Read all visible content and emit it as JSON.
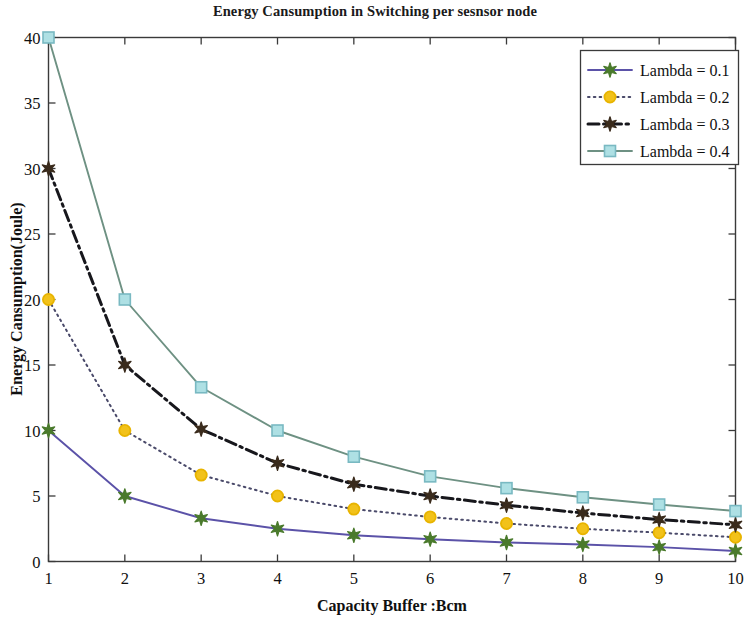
{
  "chart_data": {
    "type": "line",
    "title": "Energy Cansumption in Switching per sesnsor node",
    "xlabel": "Capacity Buffer :Bcm",
    "ylabel": "Energy Cansumption(Joule)",
    "x": [
      1,
      2,
      3,
      4,
      5,
      6,
      7,
      8,
      9,
      10
    ],
    "xlim": [
      1,
      10
    ],
    "ylim": [
      0,
      40
    ],
    "xticks": [
      "1",
      "2",
      "3",
      "4",
      "5",
      "6",
      "7",
      "8",
      "9",
      "10"
    ],
    "yticks": [
      "0",
      "5",
      "10",
      "15",
      "20",
      "25",
      "30",
      "35",
      "40"
    ],
    "grid": false,
    "legend_position": "upper right",
    "series": [
      {
        "name": "Lambda = 0.1",
        "values": [
          10,
          5,
          3.3,
          2.5,
          2,
          1.7,
          1.45,
          1.3,
          1.1,
          0.8
        ],
        "color": "#5b52a8",
        "marker": "star",
        "marker_color": "#4a7a2c",
        "dash": "solid"
      },
      {
        "name": "Lambda = 0.2",
        "values": [
          20,
          10,
          6.6,
          5,
          4,
          3.4,
          2.9,
          2.5,
          2.2,
          1.85
        ],
        "color": "#4a4a6a",
        "marker": "circle",
        "marker_color": "#f2c21a",
        "dash": "dotted"
      },
      {
        "name": "Lambda = 0.3",
        "values": [
          30,
          15,
          10.1,
          7.5,
          5.9,
          5.0,
          4.3,
          3.7,
          3.2,
          2.8
        ],
        "color": "#17171c",
        "marker": "star",
        "marker_color": "#3a2b1c",
        "dash": "dashdot"
      },
      {
        "name": "Lambda = 0.4",
        "values": [
          40,
          20,
          13.3,
          10.0,
          8.0,
          6.5,
          5.6,
          4.9,
          4.35,
          3.85
        ],
        "color": "#6e9183",
        "marker": "square",
        "marker_color": "#aee0e4",
        "dash": "solid"
      }
    ]
  },
  "legend": {
    "entries": [
      {
        "label": "Lambda = 0.1"
      },
      {
        "label": "Lambda = 0.2"
      },
      {
        "label": "Lambda = 0.3"
      },
      {
        "label": "Lambda = 0.4"
      }
    ]
  },
  "colors": {
    "background": "#ffffff",
    "axis": "#3a3a3a",
    "text": "#101010"
  }
}
